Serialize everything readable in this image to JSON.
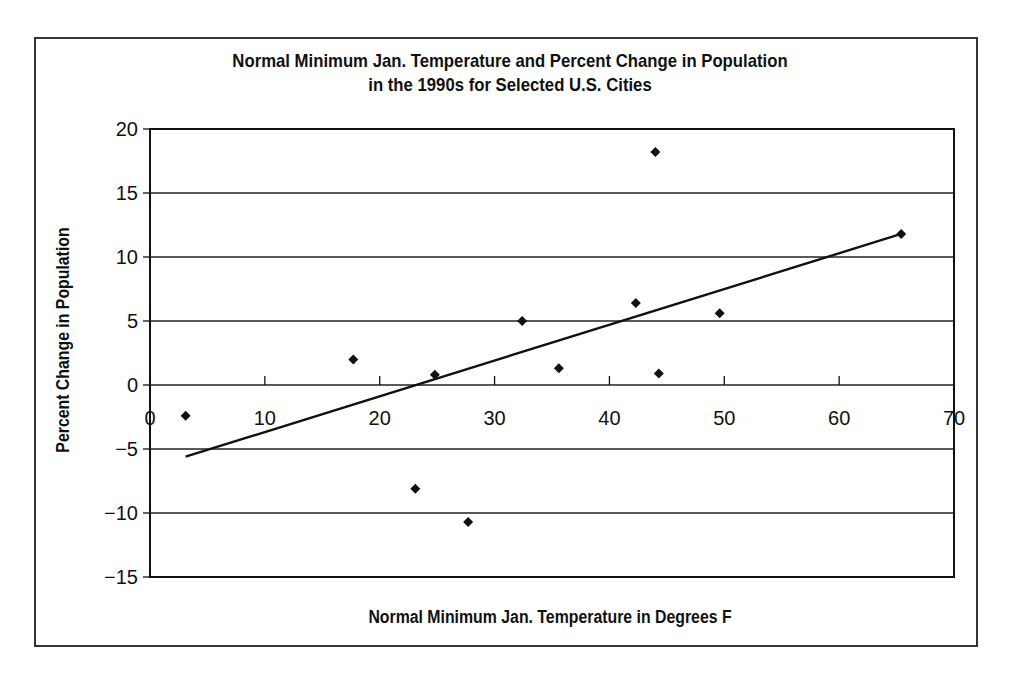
{
  "chart_data": {
    "type": "scatter",
    "title_lines": [
      "Normal Minimum Jan. Temperature and Percent Change in Population",
      "in the 1990s for Selected U.S. Cities"
    ],
    "xlabel": "Normal Minimum Jan. Temperature in Degrees F",
    "ylabel": "Percent Change in Population",
    "xlim": [
      0,
      70
    ],
    "ylim": [
      -15,
      20
    ],
    "xticks": [
      0,
      10,
      20,
      30,
      40,
      50,
      60,
      70
    ],
    "yticks": [
      20,
      15,
      10,
      5,
      0,
      -5,
      -10,
      -15
    ],
    "xtick_labels": [
      "0",
      "10",
      "20",
      "30",
      "40",
      "50",
      "60",
      "70"
    ],
    "ytick_labels": [
      "20",
      "15",
      "10",
      "5",
      "0",
      "−5",
      "−10",
      "−15"
    ],
    "grid": {
      "horizontal": true,
      "vertical": false
    },
    "legend": null,
    "marker": "diamond",
    "series": [
      {
        "name": "Cities",
        "points": [
          {
            "x": 3.1,
            "y": -2.4
          },
          {
            "x": 17.7,
            "y": 2.0
          },
          {
            "x": 23.1,
            "y": -8.1
          },
          {
            "x": 24.8,
            "y": 0.8
          },
          {
            "x": 27.7,
            "y": -10.7
          },
          {
            "x": 32.4,
            "y": 5.0
          },
          {
            "x": 35.6,
            "y": 1.3
          },
          {
            "x": 42.3,
            "y": 6.4
          },
          {
            "x": 44.0,
            "y": 18.2
          },
          {
            "x": 44.3,
            "y": 0.9
          },
          {
            "x": 49.6,
            "y": 5.6
          },
          {
            "x": 65.4,
            "y": 11.8
          }
        ]
      }
    ],
    "trendline": {
      "type": "linear",
      "x1": 3.1,
      "y1": -5.6,
      "x2": 65.4,
      "y2": 11.8
    }
  }
}
